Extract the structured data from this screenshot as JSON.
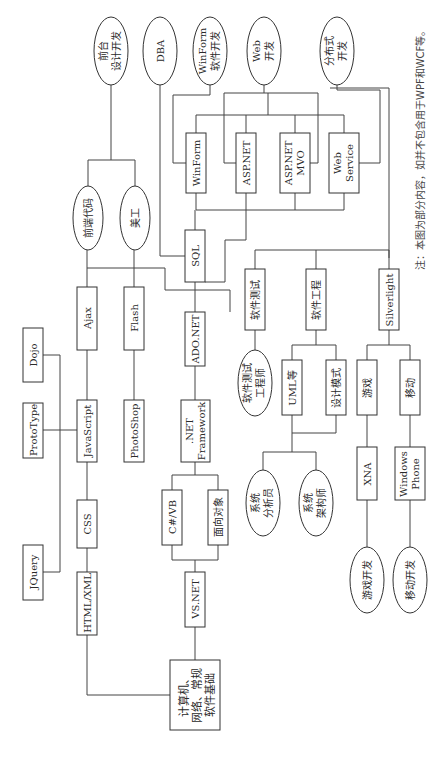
{
  "diagram": {
    "title": "",
    "orientation": "rotated-90-ccw",
    "colors": {
      "stroke": "#333333",
      "text": "#2a2a2a",
      "background": "#ffffff"
    },
    "root": {
      "id": "root",
      "lines": [
        "计算机、",
        "网络、常规",
        "软件基础"
      ]
    },
    "boxes": {
      "html_xml": {
        "lines": [
          "HTML/XML"
        ]
      },
      "css": {
        "lines": [
          "CSS"
        ]
      },
      "javascript": {
        "lines": [
          "JavaScript"
        ]
      },
      "ajax": {
        "lines": [
          "Ajax"
        ]
      },
      "jquery": {
        "lines": [
          "JQuery"
        ]
      },
      "prototype": {
        "lines": [
          "ProtoType"
        ]
      },
      "dojo": {
        "lines": [
          "Dojo"
        ]
      },
      "photoshop": {
        "lines": [
          "PhotoShop"
        ]
      },
      "flash": {
        "lines": [
          "Flash"
        ]
      },
      "vsnet": {
        "lines": [
          "VS.NET"
        ]
      },
      "csharp_vb": {
        "lines": [
          "C#/VB"
        ]
      },
      "oop": {
        "lines": [
          "面向对象"
        ]
      },
      "dotnet_framework": {
        "lines": [
          ".NET",
          "Framework"
        ]
      },
      "adonet": {
        "lines": [
          "ADO.NET"
        ]
      },
      "sql": {
        "lines": [
          "SQL"
        ]
      },
      "winform": {
        "lines": [
          "WinForm"
        ]
      },
      "aspnet": {
        "lines": [
          "ASP.NET"
        ]
      },
      "aspnet_mvo": {
        "lines": [
          "ASP.NET",
          "MVO"
        ]
      },
      "web_service": {
        "lines": [
          "Web",
          "Service"
        ]
      },
      "software_testing": {
        "lines": [
          "软件测试"
        ]
      },
      "software_engineering": {
        "lines": [
          "软件工程"
        ]
      },
      "silverlight": {
        "lines": [
          "Silverlight"
        ]
      },
      "uml": {
        "lines": [
          "UML等"
        ]
      },
      "design_patterns": {
        "lines": [
          "设计模式"
        ]
      },
      "game": {
        "lines": [
          "游戏"
        ]
      },
      "mobile": {
        "lines": [
          "移动"
        ]
      },
      "xna": {
        "lines": [
          "XNA"
        ]
      },
      "windows_phone": {
        "lines": [
          "Windows",
          "Phone"
        ]
      }
    },
    "roles": {
      "frontend_code": {
        "lines": [
          "前端代码"
        ]
      },
      "art_design": {
        "lines": [
          "美工"
        ]
      },
      "frontend_design_dev": {
        "lines": [
          "前台",
          "设计开发"
        ]
      },
      "dba": {
        "lines": [
          "DBA"
        ]
      },
      "winform_dev": {
        "lines": [
          "WinForm",
          "软件开发"
        ]
      },
      "web_dev": {
        "lines": [
          "Web",
          "开发"
        ]
      },
      "distributed_dev": {
        "lines": [
          "分布式",
          "开发"
        ]
      },
      "test_engineer": {
        "lines": [
          "软件测试",
          "工程师"
        ]
      },
      "system_analyst": {
        "lines": [
          "系统",
          "分析员"
        ]
      },
      "system_architect": {
        "lines": [
          "系统",
          "架构师"
        ]
      },
      "game_dev": {
        "lines": [
          "游戏开发"
        ]
      },
      "mobile_dev": {
        "lines": [
          "移动开发"
        ]
      }
    },
    "edges": [
      [
        "root",
        "html_xml"
      ],
      [
        "root",
        "vsnet"
      ],
      [
        "html_xml",
        "css"
      ],
      [
        "css",
        "javascript"
      ],
      [
        "javascript",
        "ajax"
      ],
      [
        "javascript",
        "jquery"
      ],
      [
        "javascript",
        "prototype"
      ],
      [
        "javascript",
        "dojo"
      ],
      [
        "ajax",
        "frontend_code"
      ],
      [
        "photoshop",
        "flash"
      ],
      [
        "flash",
        "art_design"
      ],
      [
        "frontend_code",
        "frontend_design_dev"
      ],
      [
        "art_design",
        "frontend_design_dev"
      ],
      [
        "ajax",
        "adonet"
      ],
      [
        "vsnet",
        "csharp_vb"
      ],
      [
        "vsnet",
        "oop"
      ],
      [
        "csharp_vb",
        "dotnet_framework"
      ],
      [
        "oop",
        "dotnet_framework"
      ],
      [
        "dotnet_framework",
        "adonet"
      ],
      [
        "adonet",
        "sql"
      ],
      [
        "sql",
        "dba"
      ],
      [
        "sql",
        "winform"
      ],
      [
        "sql",
        "aspnet"
      ],
      [
        "sql",
        "aspnet_mvo"
      ],
      [
        "sql",
        "web_service"
      ],
      [
        "winform",
        "winform_dev"
      ],
      [
        "aspnet",
        "web_dev"
      ],
      [
        "aspnet_mvo",
        "web_dev"
      ],
      [
        "web_service",
        "distributed_dev"
      ],
      [
        "winform",
        "distributed_dev"
      ],
      [
        "aspnet",
        "software_testing"
      ],
      [
        "aspnet",
        "software_engineering"
      ],
      [
        "aspnet",
        "silverlight"
      ],
      [
        "software_testing",
        "test_engineer"
      ],
      [
        "software_engineering",
        "uml"
      ],
      [
        "software_engineering",
        "design_patterns"
      ],
      [
        "uml",
        "system_analyst"
      ],
      [
        "uml",
        "system_architect"
      ],
      [
        "design_patterns",
        "system_analyst"
      ],
      [
        "silverlight",
        "game"
      ],
      [
        "silverlight",
        "mobile"
      ],
      [
        "game",
        "xna"
      ],
      [
        "mobile",
        "windows_phone"
      ],
      [
        "xna",
        "game_dev"
      ],
      [
        "windows_phone",
        "mobile_dev"
      ]
    ],
    "note": "注：本图为部分内容，如并不包含用于WPF和WCF等。"
  }
}
